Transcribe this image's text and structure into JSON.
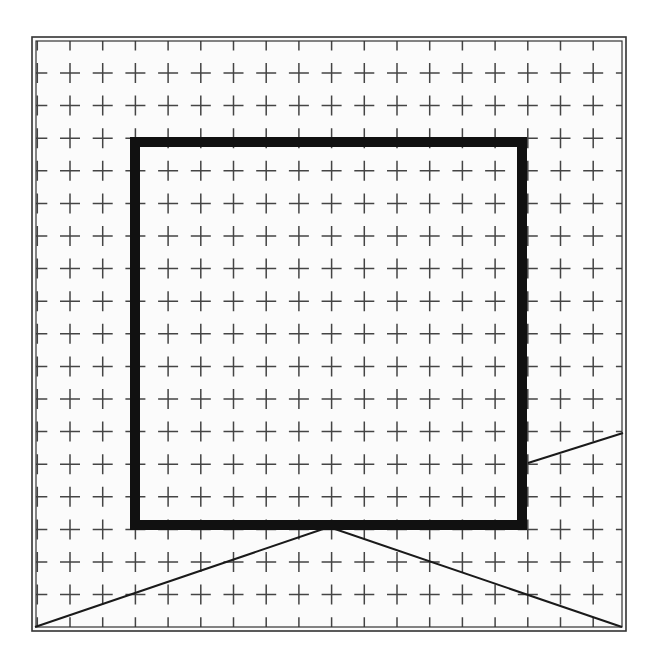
{
  "canvas": {
    "width": 662,
    "height": 671,
    "background": "#ffffff"
  },
  "frame": {
    "outer": {
      "x": 32,
      "y": 37,
      "width": 594,
      "height": 594
    },
    "inner_inset": 4,
    "color": "#333333",
    "background": "#fbfbfb"
  },
  "grid": {
    "type": "plus-marks",
    "origin_x": 70,
    "origin_y": 73,
    "spacing_x": 32.7,
    "spacing_y": 32.6,
    "columns": 17,
    "rows": 17,
    "arm_length": 10,
    "color": "#444444",
    "edge_ticks": true
  },
  "square": {
    "x": 135,
    "y": 142,
    "width": 387,
    "height": 383,
    "stroke_width": 10,
    "color": "#111111"
  },
  "lines": [
    {
      "name": "left-diagonal",
      "x1": 35,
      "y1": 627,
      "x2": 329,
      "y2": 527
    },
    {
      "name": "right-diagonal",
      "x1": 329,
      "y1": 527,
      "x2": 622,
      "y2": 627
    },
    {
      "name": "right-short-line",
      "x1": 528,
      "y1": 463,
      "x2": 623,
      "y2": 433
    }
  ],
  "line_color": "#1a1a1a",
  "line_width": 2
}
